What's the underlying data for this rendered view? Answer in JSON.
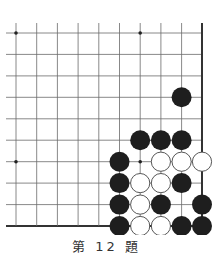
{
  "problem": {
    "caption_prefix": "第",
    "number": "12",
    "caption_suffix": "題",
    "caption": "第 12 題"
  },
  "board": {
    "columns": 10,
    "rows": 10,
    "x_positions": [
      16,
      36.7,
      57.4,
      78.1,
      98.8,
      119.5,
      140.2,
      160.9,
      181.6,
      202
    ],
    "y_positions": [
      33,
      54.4,
      75.9,
      97.3,
      118.8,
      140.2,
      161.7,
      183.1,
      204.6,
      226
    ],
    "open_left": true,
    "open_top": true,
    "edge_right": true,
    "edge_bottom": true,
    "star_points": [
      [
        0,
        0
      ],
      [
        6,
        0
      ],
      [
        0,
        6
      ],
      [
        6,
        6
      ]
    ],
    "line_color": "#6a6a6a",
    "edge_color": "#333333",
    "black_color": "#1e1e1e",
    "white_fill": "#ffffff",
    "white_stroke": "#444444",
    "stones": [
      {
        "color": "black",
        "col": 8,
        "row": 3
      },
      {
        "color": "black",
        "col": 6,
        "row": 5
      },
      {
        "color": "black",
        "col": 7,
        "row": 5
      },
      {
        "color": "black",
        "col": 8,
        "row": 5
      },
      {
        "color": "black",
        "col": 5,
        "row": 6
      },
      {
        "color": "white",
        "col": 7,
        "row": 6
      },
      {
        "color": "white",
        "col": 8,
        "row": 6
      },
      {
        "color": "white",
        "col": 9,
        "row": 6
      },
      {
        "color": "black",
        "col": 5,
        "row": 7
      },
      {
        "color": "white",
        "col": 6,
        "row": 7
      },
      {
        "color": "white",
        "col": 7,
        "row": 7
      },
      {
        "color": "black",
        "col": 8,
        "row": 7
      },
      {
        "color": "black",
        "col": 5,
        "row": 8
      },
      {
        "color": "white",
        "col": 6,
        "row": 8
      },
      {
        "color": "black",
        "col": 7,
        "row": 8
      },
      {
        "color": "black",
        "col": 9,
        "row": 8
      },
      {
        "color": "black",
        "col": 5,
        "row": 9
      },
      {
        "color": "white",
        "col": 6,
        "row": 9
      },
      {
        "color": "white",
        "col": 7,
        "row": 9
      },
      {
        "color": "black",
        "col": 8,
        "row": 9
      },
      {
        "color": "black",
        "col": 9,
        "row": 9
      }
    ]
  }
}
